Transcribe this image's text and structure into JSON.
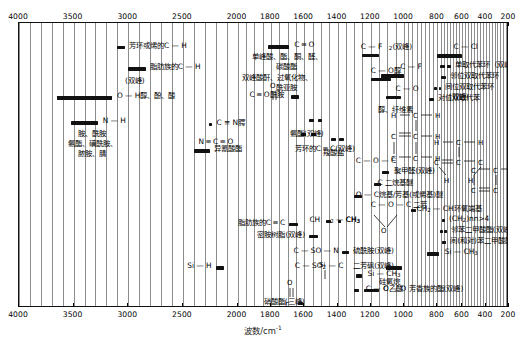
{
  "chart_data": {
    "type": "table",
    "xlabel": "波数/cm",
    "xlabel_sup": "-1",
    "xlim": [
      4000,
      200
    ],
    "x_ticks": [
      4000,
      3500,
      3000,
      2500,
      2000,
      1800,
      1600,
      1400,
      1200,
      1000,
      800,
      600,
      400,
      200
    ],
    "x_minor_step_high": 100,
    "grid": true,
    "legend": "none",
    "axis_top": true,
    "axis_bottom": true,
    "bands": [
      {
        "label": "芳环或烯的C — H",
        "from": 3100,
        "to": 3030,
        "label_side": "right",
        "row": 1
      },
      {
        "label": "脂肪族的C — H",
        "from": 3000,
        "to": 2840,
        "label_side": "right",
        "row": 2
      },
      {
        "label": "(双峰)",
        "from": 0,
        "to": 0,
        "label_side": "none",
        "row": 3
      },
      {
        "label": "O — H醇、酚、酸",
        "from": 3650,
        "to": 3100,
        "label_side": "right",
        "row": 4
      },
      {
        "label": "N — H",
        "from": 3500,
        "to": 3280,
        "label_side": "right",
        "row": 5
      },
      {
        "label": "胺、酰胺",
        "from": 0,
        "to": 0,
        "label_side": "none",
        "row": 6
      },
      {
        "label": "氨酯、磺酰胺、",
        "from": 0,
        "to": 0,
        "label_side": "none",
        "row": 7
      },
      {
        "label": "脓胺、腈",
        "from": 0,
        "to": 0,
        "label_side": "none",
        "row": 8
      },
      {
        "label": "C ═ O",
        "from": 1820,
        "to": 1660,
        "label_side": "right",
        "row": 9
      },
      {
        "label": "单峰酸、酯、酮、醛、",
        "from": 0,
        "to": 0,
        "label_side": "none",
        "row": 10
      },
      {
        "label": "碳酸酯",
        "from": 0,
        "to": 0,
        "label_side": "none",
        "row": 11
      },
      {
        "label": "双峰酸酐、过氧化物、",
        "from": 0,
        "to": 0,
        "label_side": "none",
        "row": 12
      },
      {
        "label": "酰亚胺",
        "from": 0,
        "to": 0,
        "label_side": "none",
        "row": 13
      },
      {
        "label": "C ═ O酰胺",
        "from": 1680,
        "to": 1630,
        "label_side": "left",
        "row": 14
      },
      {
        "label": "C ≡ N腭",
        "from": 2260,
        "to": 2220,
        "label_side": "right",
        "row": 15
      },
      {
        "label": "N ═ C ═ O",
        "from": 2280,
        "to": 2240,
        "label_side": "right",
        "row": 16
      },
      {
        "label": "异氰酸酯",
        "from": 2300,
        "to": 2240,
        "label_side": "right",
        "row": 17
      },
      {
        "label": "芳环的C ═ C(双峰)",
        "from": 1620,
        "to": 1570,
        "label_side": "right",
        "row": 18
      },
      {
        "label": "脂肪族的C ═ C",
        "from": 1680,
        "to": 1620,
        "label_side": "right",
        "row": 19
      },
      {
        "label": "密胺树脂(双峰)",
        "from": 1560,
        "to": 1480,
        "label_side": "right",
        "row": 20
      },
      {
        "label": "C — SO — N",
        "from": 1360,
        "to": 1300,
        "label_side": "right",
        "row": 21
      },
      {
        "label": "C — SO₂ — C",
        "from": 1340,
        "to": 1280,
        "label_side": "right",
        "row": 22
      },
      {
        "label": "Si — H",
        "from": 2250,
        "to": 2100,
        "label_side": "right",
        "row": 23
      },
      {
        "label": "硫酰胺(双峰)",
        "from": 1370,
        "to": 1330,
        "label_side": "right",
        "row": 24
      },
      {
        "label": "二芳砜(双峰)",
        "from": 1330,
        "to": 1290,
        "label_side": "right",
        "row": 25
      },
      {
        "label": "硝酸酯(三峰)",
        "from": 1640,
        "to": 1600,
        "label_side": "right",
        "row": 26
      },
      {
        "label": "二醇胺、碳酸酯、酰胺",
        "from": 0,
        "to": 0,
        "label_side": "none",
        "row": 27
      },
      {
        "label": "C — F₂(双峰)",
        "from": 1250,
        "to": 1150,
        "label_side": "right",
        "row": 28
      },
      {
        "label": "C — O醇",
        "from": 1200,
        "to": 1050,
        "label_side": "right",
        "row": 29
      },
      {
        "label": "C — F",
        "from": 1120,
        "to": 1000,
        "label_side": "right",
        "row": 30
      },
      {
        "label": "C — O",
        "from": 1100,
        "to": 1000,
        "label_side": "right",
        "row": 31
      },
      {
        "label": "醇、纤维素",
        "from": 0,
        "to": 0,
        "label_side": "none",
        "row": 32
      },
      {
        "label": "C — Cl",
        "from": 800,
        "to": 600,
        "label_side": "right",
        "row": 33
      },
      {
        "label": "单取代苯环（双峰）",
        "from": 760,
        "to": 690,
        "label_side": "right",
        "row": 34
      },
      {
        "label": "邻位双取代苯环",
        "from": 760,
        "to": 735,
        "label_side": "right",
        "row": 35
      },
      {
        "label": "间位双取代苯环",
        "from": 800,
        "to": 770,
        "label_side": "right",
        "row": 36
      },
      {
        "label": "(双峰)",
        "from": 0,
        "to": 0,
        "label_side": "none",
        "row": 37
      },
      {
        "label": "对位双取代苯",
        "from": 850,
        "to": 790,
        "label_side": "right",
        "row": 38
      },
      {
        "label": "聚甲醛(双峰)",
        "from": 1120,
        "to": 1080,
        "label_side": "right",
        "row": 39
      },
      {
        "label": "C 二烷基醚",
        "from": 1150,
        "to": 1060,
        "label_side": "right",
        "row": 40
      },
      {
        "label": "O — C烷基/芳基(或烯基)醚",
        "from": 1270,
        "to": 1200,
        "label_side": "right",
        "row": 41
      },
      {
        "label": "CH₂ — CH环氧端基",
        "from": 950,
        "to": 810,
        "label_side": "right",
        "row": 42
      },
      {
        "label": "(CH₂)ₙn>4",
        "from": 740,
        "to": 710,
        "label_side": "right",
        "row": 43
      },
      {
        "label": "邻苯二甲酸酯(双峰)",
        "from": 750,
        "to": 700,
        "label_side": "right",
        "row": 44
      },
      {
        "label": "间(和对)苯二甲酸酯",
        "from": 740,
        "to": 710,
        "label_side": "right",
        "row": 45
      },
      {
        "label": "Si — CH₃",
        "from": 1280,
        "to": 1240,
        "label_side": "right",
        "row": 46
      },
      {
        "label": "硅氧烷",
        "from": 1100,
        "to": 1000,
        "label_side": "right",
        "row": 47
      },
      {
        "label": "C — O 芳香族的酯(双峰)",
        "from": 1300,
        "to": 1100,
        "label_side": "right",
        "row": 48
      },
      {
        "label": "CH₂ — CH₃",
        "from": 1470,
        "to": 1430,
        "label_side": "right",
        "row": 49
      },
      {
        "label": "CH₃",
        "from": 1390,
        "to": 1360,
        "label_side": "right",
        "row": 50
      },
      {
        "label": "氨酯(双峰)",
        "from": 1560,
        "to": 1520,
        "label_side": "right",
        "row": 51
      },
      {
        "label": "羧酸盐",
        "from": 1420,
        "to": 1380,
        "label_side": "right",
        "row": 52
      },
      {
        "label": "C — O — C",
        "from": 1280,
        "to": 1200,
        "label_side": "right",
        "row": 53
      },
      {
        "label": "C — O — C 二芳",
        "from": 1250,
        "to": 1200,
        "label_side": "right",
        "row": 54
      },
      {
        "label": "C — O乙酸",
        "from": 1260,
        "to": 1220,
        "label_side": "right",
        "row": 55
      },
      {
        "label": "硝酸酯(三峰)",
        "from": 0,
        "to": 0,
        "label_side": "none",
        "row": 56
      }
    ]
  },
  "axis": {
    "ticks": [
      "4000",
      "3500",
      "3000",
      "2500",
      "2000",
      "1800",
      "1600",
      "1400",
      "1200",
      "1000",
      "800",
      "600",
      "400",
      "200"
    ],
    "label_text": "波数/cm",
    "label_sup": "-1"
  },
  "annotations": {
    "a1": "芳环或烯的C — H",
    "a2": "脂肪族的C — H",
    "a3": "(双峰)",
    "a4": "O — H醇、酚、酸",
    "a5": "N — H",
    "a6": "胺、酰胺",
    "a7": "氨酯、磺酰胺、",
    "a8": "脓胺、腈",
    "a9": "C ═ O",
    "a10": "单峰酸、酯、酮、醛、",
    "a11": "碳酸酯",
    "a12": "双峰酸酐、过氧化物、",
    "a13": "酰亚胺",
    "a14": "C ═ O酰胺",
    "a15": "C ≡ N腭",
    "a16": "N ═ C ═ O",
    "a17": "异氰酸酯",
    "a18": "芳环的C ═ C(双峰)",
    "a19": "脂肪族的C ═ C",
    "a20": "密胺树脂(双峰)",
    "a21": "C — SO — N",
    "a22": "C — SO",
    "a22b": "2",
    "a22c": " — C",
    "a23": "Si — H",
    "a24": "硫酰胺(双峰)",
    "a25": "二芳砜(双峰)",
    "a26": "硝酸酯(三峰)",
    "a27": "二醇胺、碳酸酯、酰胺",
    "a28": "C — F",
    "a28b": "2",
    "a28c": "(双峰)",
    "a29": "C — O醇",
    "a30": "C — F",
    "a31": "C — O",
    "a32": "醇、纤维素",
    "a33": "C — Cl",
    "a34": "单取代苯环（双峰）",
    "a35": "邻位双取代苯环",
    "a36": "间位双取代苯环",
    "a37": "(双峰)",
    "a38": "对位双取代苯",
    "a39": "聚甲醛(双峰)",
    "a40": "C 二烷基醚",
    "a41": "O — C烷基/芳基(或烯基)醚",
    "a42": "CH",
    "a42b": "2",
    "a42c": " — CH环氧端基",
    "a43": "(CH",
    "a43b": "2",
    "a43c": ")",
    "a43d": "n",
    "a43e": "n>4",
    "a44": "邻苯二甲酸酯(双峰)",
    "a45": "间(和对)苯二甲酸酯",
    "a46": "Si — CH",
    "a46b": "3",
    "a47": "硅氧烷",
    "a48": "C — O 芳香族的酯(双峰)",
    "a49": "CH",
    "a49b": "2",
    "a49c": " — CH",
    "a49d": "3",
    "a50": "CH",
    "a50b": "3",
    "a51": "氨酯(双峰)",
    "a52": "羧酸盐",
    "a53": "C — O — C",
    "a54": "C — O — C 二芳",
    "a55": "C — O乙酸",
    "a56": "Si — CH",
    "a56b": "3",
    "a57": "Si",
    "a58": "O",
    "a59": "O"
  },
  "colors": {
    "band": "#111111",
    "grid": "#8d8d8d",
    "frame": "#111111",
    "background": "#ffffff"
  }
}
